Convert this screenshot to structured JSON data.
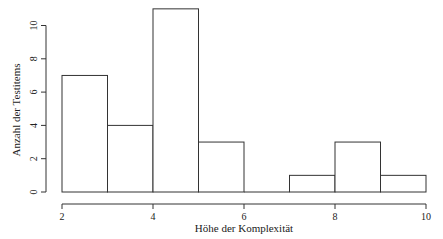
{
  "chart_data": {
    "type": "bar",
    "subtype": "histogram",
    "title": "",
    "xlabel": "Höhe der Komplexität",
    "ylabel": "Anzahl der Testitems",
    "bins": [
      [
        2,
        3
      ],
      [
        3,
        4
      ],
      [
        4,
        5
      ],
      [
        5,
        6
      ],
      [
        6,
        7
      ],
      [
        7,
        8
      ],
      [
        8,
        9
      ],
      [
        9,
        10
      ]
    ],
    "categories": [
      "2-3",
      "3-4",
      "4-5",
      "5-6",
      "6-7",
      "7-8",
      "8-9",
      "9-10"
    ],
    "values": [
      7,
      4,
      11,
      3,
      0,
      1,
      3,
      1
    ],
    "xlim": [
      2,
      10
    ],
    "ylim": [
      0,
      11
    ],
    "xticks": [
      "2",
      "4",
      "6",
      "8",
      "10"
    ],
    "yticks": [
      "0",
      "2",
      "4",
      "6",
      "8",
      "10"
    ],
    "grid": false,
    "legend": null,
    "colors": {
      "bar_fill": "#ffffff",
      "bar_stroke": "#333333",
      "axis": "#333333"
    }
  }
}
